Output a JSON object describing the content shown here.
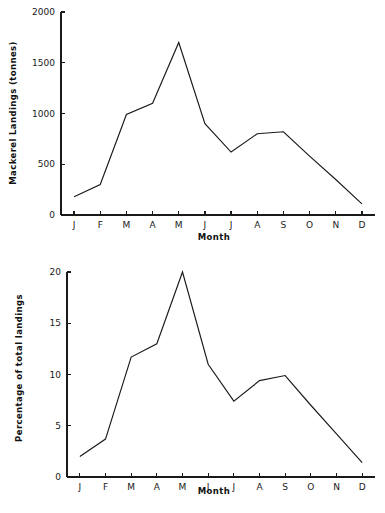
{
  "page": {
    "background_color": "#ffffff",
    "ink_color": "#1a1a1a",
    "bottom_caption": ""
  },
  "chart_data": [
    {
      "id": "mackerel-landings-tonnes",
      "type": "line",
      "title": "",
      "xlabel": "Month",
      "ylabel": "Mackerel Landings (tonnes)",
      "categories": [
        "J",
        "F",
        "M",
        "A",
        "M",
        "J",
        "J",
        "A",
        "S",
        "O",
        "N",
        "D"
      ],
      "category_names": [
        "January",
        "February",
        "March",
        "April",
        "May",
        "June",
        "July",
        "August",
        "September",
        "October",
        "November",
        "December"
      ],
      "values": [
        180,
        300,
        990,
        1100,
        1700,
        900,
        620,
        800,
        820,
        580,
        350,
        110
      ],
      "ylim": [
        0,
        2000
      ],
      "yticks": [
        0,
        500,
        1000,
        1500,
        2000
      ],
      "ytick_labels": [
        "0",
        "500",
        "1000",
        "1500",
        "2000"
      ],
      "grid": false,
      "legend": "none",
      "line_color": "#1a1a1a"
    },
    {
      "id": "percentage-of-total-landings",
      "type": "line",
      "title": "",
      "xlabel": "Month",
      "ylabel": "Percentage of total landings",
      "categories": [
        "J",
        "F",
        "M",
        "A",
        "M",
        "J",
        "J",
        "A",
        "S",
        "O",
        "N",
        "D"
      ],
      "category_names": [
        "January",
        "February",
        "March",
        "April",
        "May",
        "June",
        "July",
        "August",
        "September",
        "October",
        "November",
        "December"
      ],
      "values": [
        2.0,
        3.7,
        11.7,
        13.0,
        20.0,
        11.0,
        7.4,
        9.4,
        9.9,
        7.0,
        4.2,
        1.4
      ],
      "ylim": [
        0,
        20
      ],
      "yticks": [
        0,
        5,
        10,
        15,
        20
      ],
      "ytick_labels": [
        "0",
        "5",
        "10",
        "15",
        "20"
      ],
      "grid": false,
      "legend": "none",
      "line_color": "#1a1a1a"
    }
  ]
}
